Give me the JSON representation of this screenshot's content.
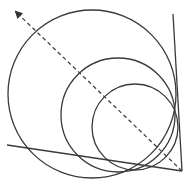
{
  "diagram": {
    "colors": {
      "background": "#ffffff",
      "stroke": "#3a3a3a"
    },
    "lines": [
      {
        "name": "right-line",
        "x1": 173,
        "y1": 14,
        "x2": 182,
        "y2": 171
      },
      {
        "name": "bottom-line",
        "x1": 7,
        "y1": 145,
        "x2": 182,
        "y2": 171
      }
    ],
    "circles": [
      {
        "name": "large",
        "cx": 92,
        "cy": 94,
        "r": 84
      },
      {
        "name": "medium",
        "cx": 118,
        "cy": 115,
        "r": 57
      },
      {
        "name": "small",
        "cx": 135,
        "cy": 127,
        "r": 43
      }
    ],
    "arrow": {
      "x1": 182,
      "y1": 171,
      "x2": 16,
      "y2": 12,
      "style": "dashed",
      "head": "end"
    }
  }
}
